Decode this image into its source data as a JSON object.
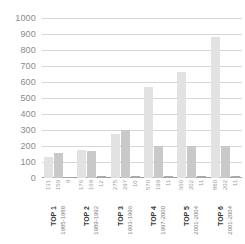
{
  "chart_data": {
    "type": "bar",
    "title": "",
    "subtitle": "",
    "xlabel": "",
    "ylabel": "",
    "ylim": [
      0,
      1000
    ],
    "grid": true,
    "legend": "none",
    "y_ticks": [
      1000,
      900,
      800,
      700,
      600,
      500,
      400,
      300,
      200,
      100,
      0
    ],
    "categories": [
      "TOP 1",
      "TOP 2",
      "TOP 3",
      "TOP 4",
      "TOP 5",
      "TOP 6"
    ],
    "category_sublabels": [
      "1985-1988",
      "1989-1992",
      "1993-1996",
      "1997-2000",
      "2001-2004",
      "2001-2004"
    ],
    "series": [
      {
        "name": "Series 1",
        "color": "#e2e2e2",
        "values": [
          131,
          176,
          275,
          570,
          660,
          880
        ]
      },
      {
        "name": "Series 2",
        "color": "#c9c9c9",
        "values": [
          159,
          169,
          297,
          199,
          202,
          202
        ]
      },
      {
        "name": "Series 3",
        "color": "#a9a9a9",
        "values": [
          9,
          12,
          10,
          11,
          11,
          11
        ]
      }
    ],
    "value_labels": [
      [
        "131",
        "159",
        "9"
      ],
      [
        "176",
        "169",
        "12"
      ],
      [
        "275",
        "297",
        "10"
      ],
      [
        "570",
        "199",
        "11"
      ],
      [
        "660",
        "202",
        "11"
      ],
      [
        "880",
        "202",
        "11"
      ]
    ]
  },
  "colors": {
    "gridline": "#d6d6d6",
    "baseline": "#9a9a9a",
    "tick_text": "#8a8a8a",
    "category_text": "#3a3a3a",
    "year_text": "#7c7c7c",
    "value_label_text": "#9d9d9d",
    "background": "#ffffff"
  }
}
